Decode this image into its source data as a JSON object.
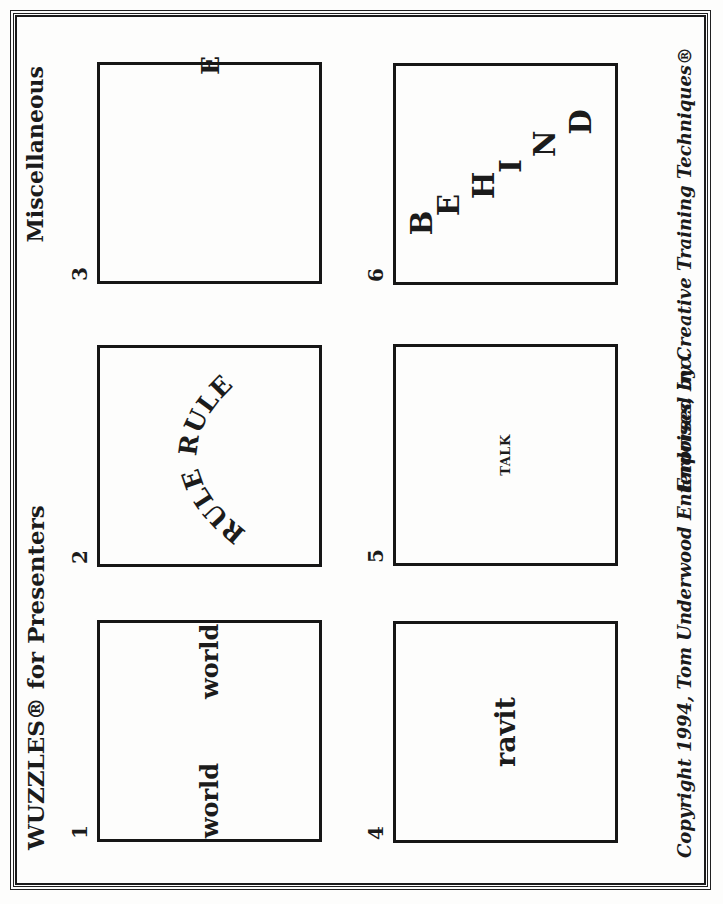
{
  "document": {
    "title": "WUZZLES® for Presenters",
    "category": "Miscellaneous",
    "copyright": "Copyright 1994, Tom Underwood Enterprises, Inc.",
    "endorsement": "Endorsed by Creative Training Techniques®",
    "colors": {
      "ink": "#1b1b1b",
      "paper": "#fdfdfc"
    },
    "orientation_note": "landscape page rotated 90° counter-clockwise",
    "puzzles": [
      {
        "number": "1",
        "words": [
          "world",
          "world"
        ],
        "layout": "two-words-apart-centered"
      },
      {
        "number": "2",
        "text": "RULE RULE",
        "layout": "arched-text"
      },
      {
        "number": "3",
        "text": "E",
        "layout": "letter-on-right-border"
      },
      {
        "number": "4",
        "text": "ravit",
        "layout": "centered"
      },
      {
        "number": "5",
        "text": "TALK",
        "layout": "small-centered"
      },
      {
        "number": "6",
        "letters": [
          "B",
          "E",
          "H",
          "I",
          "N",
          "D"
        ],
        "layout": "diagonal-descending"
      }
    ]
  }
}
